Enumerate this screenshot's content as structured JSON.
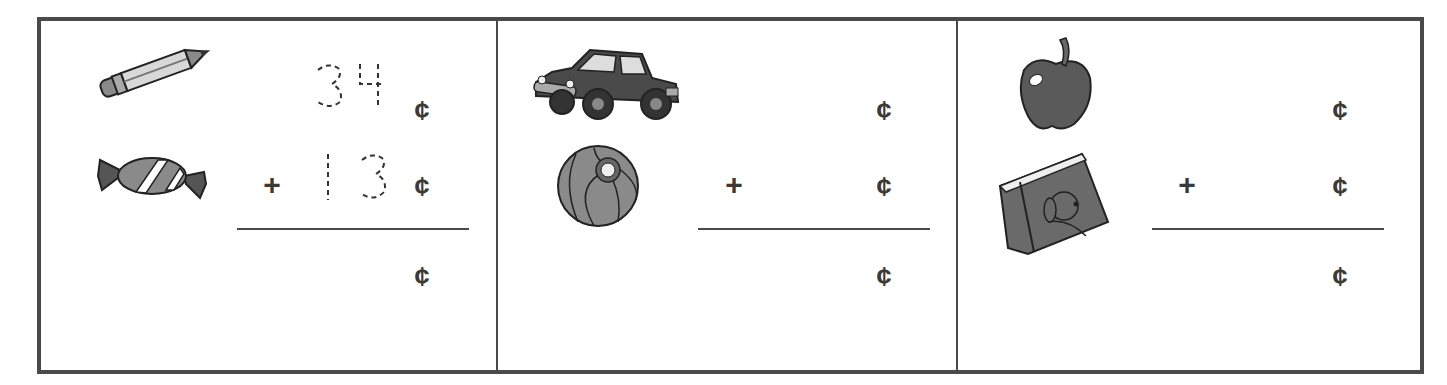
{
  "worksheet": {
    "currency_symbol": "¢",
    "operator": "+",
    "panels": [
      {
        "items": [
          {
            "name": "pencil",
            "icon": "pencil-icon",
            "price_traced": "34"
          },
          {
            "name": "candy",
            "icon": "candy-icon",
            "price_traced": "13"
          }
        ],
        "addend1": "34",
        "addend2": "13",
        "sum": ""
      },
      {
        "items": [
          {
            "name": "toy car",
            "icon": "car-icon",
            "price_traced": ""
          },
          {
            "name": "beach ball",
            "icon": "ball-icon",
            "price_traced": ""
          }
        ],
        "addend1": "",
        "addend2": "",
        "sum": ""
      },
      {
        "items": [
          {
            "name": "apple",
            "icon": "apple-icon",
            "price_traced": ""
          },
          {
            "name": "book",
            "icon": "book-icon",
            "price_traced": ""
          }
        ],
        "addend1": "",
        "addend2": "",
        "sum": ""
      }
    ]
  },
  "colors": {
    "border": "#4a4a4a",
    "ink": "#3a3a3a",
    "fill_dark": "#5a5a5a",
    "fill_mid": "#8a8a8a",
    "fill_light": "#c8c8c8"
  }
}
